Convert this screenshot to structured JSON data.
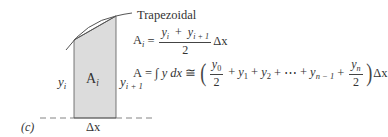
{
  "figure": {
    "panel_label": "(c)",
    "method_title": "Trapezoidal",
    "shape": {
      "fill_color": "#dcdcdc",
      "stroke_color": "#555555",
      "curve_color": "#555555",
      "area_label_base": "A",
      "area_label_sub": "i",
      "left_height_label_base": "y",
      "left_height_label_sub": "i",
      "right_height_label_base": "y",
      "right_height_label_sub": "i + 1",
      "width_label": "Δx"
    },
    "equation_1": {
      "lhs_base": "A",
      "lhs_sub": "i",
      "equals": "=",
      "numerator": {
        "t1_base": "y",
        "t1_sub": "i",
        "plus": "+",
        "t2_base": "y",
        "t2_sub": "i + 1"
      },
      "denominator": "2",
      "factor": "Δx"
    },
    "equation_2": {
      "lhs": "A",
      "equals": "=",
      "integral": "∫ y dx",
      "equiv": "≅",
      "open_paren": "(",
      "frac1": {
        "num_base": "y",
        "num_sub": "0",
        "den": "2"
      },
      "terms": [
        {
          "op": "+",
          "base": "y",
          "sub": "1"
        },
        {
          "op": "+",
          "base": "y",
          "sub": "2"
        },
        {
          "op": "+",
          "base": "⋯",
          "sub": ""
        },
        {
          "op": "+",
          "base": "y",
          "sub": "n − 1"
        }
      ],
      "plus_last": "+",
      "frac2": {
        "num_base": "y",
        "num_sub": "n",
        "den": "2"
      },
      "close_paren": ")",
      "factor": "Δx"
    }
  }
}
